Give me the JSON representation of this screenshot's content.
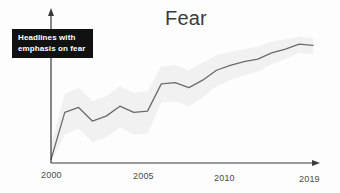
{
  "chart_data": {
    "type": "line",
    "title": "Fear",
    "xlabel": "",
    "ylabel": "",
    "grid": false,
    "legend_position": "none",
    "xlim": [
      2000,
      2019
    ],
    "ylim": [
      0,
      100
    ],
    "x": [
      2000,
      2001,
      2002,
      2003,
      2004,
      2005,
      2006,
      2007,
      2008,
      2009,
      2010,
      2011,
      2012,
      2013,
      2014,
      2015,
      2016,
      2017,
      2018,
      2019
    ],
    "series": [
      {
        "name": "Headlines with emphasis on fear",
        "values": [
          2,
          40,
          44,
          33,
          37,
          45,
          40,
          41,
          63,
          64,
          60,
          66,
          74,
          78,
          81,
          83,
          88,
          91,
          95,
          94
        ]
      }
    ],
    "band": {
      "name": "uncertainty band",
      "upper": [
        14,
        55,
        60,
        49,
        53,
        61,
        56,
        57,
        77,
        78,
        74,
        80,
        86,
        89,
        91,
        93,
        97,
        99,
        101,
        100
      ],
      "lower": [
        0,
        22,
        27,
        16,
        20,
        28,
        22,
        23,
        48,
        49,
        45,
        52,
        61,
        66,
        70,
        73,
        79,
        83,
        88,
        87
      ],
      "color": "#efefef"
    },
    "line_color": "#6b6b6b",
    "axis_color": "#3a3a3a",
    "xticks": [
      {
        "label": "2000",
        "value": 2000
      },
      {
        "label": "2005",
        "value": 2005
      },
      {
        "label": "2010",
        "value": 2010
      },
      {
        "label": "2019",
        "value": 2019
      }
    ],
    "annotations": [
      {
        "name": "fear-callout",
        "lines": [
          "Headlines with",
          "emphasis on fear"
        ],
        "background": "#111111",
        "text_color": "#ffffff"
      }
    ]
  }
}
